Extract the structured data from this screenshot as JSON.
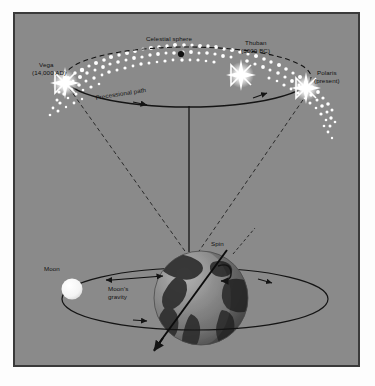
{
  "diagram": {
    "background_color": "#8a8a8a",
    "border_color": "#3a3a3a",
    "page_color": "#fdfdfd"
  },
  "labels": {
    "celestial_sphere": "Celestial sphere",
    "vega": "Vega\n(14,000 AD)",
    "vega_name": "Vega",
    "vega_date": "(14,000 AD)",
    "thuban_name": "Thuban",
    "thuban_date": "(3000 BC)",
    "polaris_name": "Polaris",
    "polaris_date": "(present)",
    "precessional_path": "Precessional path",
    "spin": "Spin",
    "moon": "Moon",
    "moons_gravity_line1": "Moon's",
    "moons_gravity_line2": "gravity"
  },
  "objects": {
    "earth": {
      "name": "Earth",
      "cx": 198,
      "cy": 296,
      "r": 47,
      "ocean_color": "#7d7d7d",
      "land_color": "#303030",
      "highlight_color": "#a6a6a6",
      "shadow_color": "#4a4a4a"
    },
    "moon": {
      "name": "Moon",
      "cx": 57,
      "cy": 275,
      "r": 10,
      "color": "#f2f2f2"
    },
    "stars": [
      {
        "name": "Vega",
        "x": 49,
        "y": 66,
        "size": 11
      },
      {
        "name": "Thuban",
        "x": 225,
        "y": 58,
        "size": 11
      },
      {
        "name": "Polaris",
        "x": 290,
        "y": 71,
        "size": 11
      }
    ],
    "celestial_sphere_dot": {
      "x": 166,
      "y": 40,
      "r": 3,
      "color": "#111111"
    }
  },
  "geometry": {
    "precession_ellipse": {
      "cx": 173,
      "cy": 63,
      "rx": 123,
      "ry": 30,
      "front_solid": true,
      "back_dashed": true
    },
    "moon_orbit": {
      "cx": 192,
      "cy": 297,
      "rx": 133,
      "ry": 31
    },
    "axis_line": {
      "x1": 187,
      "y1": 92,
      "x2": 187,
      "y2": 250
    },
    "earth_tilt_axis": {
      "x1": 222,
      "y1": 248,
      "x2": 150,
      "y2": 345
    },
    "sight_lines_dashed": 2
  },
  "colors": {
    "line": "#141414",
    "star_glow": "#ffffff",
    "label_text": "#111111"
  }
}
